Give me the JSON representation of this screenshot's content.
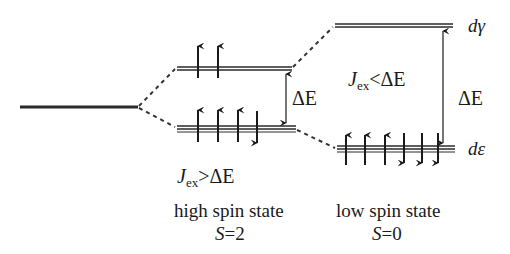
{
  "diagram": {
    "labels": {
      "delta_e_high": "ΔE",
      "delta_e_low": "ΔE",
      "d_gamma": "dγ",
      "d_epsilon": "dε",
      "cond_high_j": "J",
      "cond_high_sub": "ex",
      "cond_high_rel": ">ΔE",
      "cond_low_j": "J",
      "cond_low_sub": "ex",
      "cond_low_rel": "<ΔE",
      "high_spin_state": "high spin state",
      "high_spin_S": "S",
      "high_spin_eq": "=2",
      "low_spin_state": "low spin state",
      "low_spin_S": "S",
      "low_spin_eq": "=0"
    },
    "levels": {
      "free_ion": {
        "x1": 20,
        "x2": 138,
        "y": 107
      },
      "high_upper": {
        "x1": 177,
        "x2": 292,
        "y": 68,
        "electrons": [
          "up",
          "up"
        ]
      },
      "high_lower": {
        "x1": 177,
        "x2": 296,
        "y": 128,
        "electrons": [
          "up",
          "up",
          "up",
          "down"
        ]
      },
      "low_upper": {
        "x1": 335,
        "x2": 453,
        "y": 25,
        "electrons": []
      },
      "low_lower": {
        "x1": 337,
        "x2": 455,
        "y": 148,
        "electrons": [
          "up",
          "up",
          "up",
          "down",
          "down",
          "down"
        ]
      }
    },
    "colors": {
      "line": "#2a2a2a",
      "text": "#1a1a1a"
    }
  }
}
